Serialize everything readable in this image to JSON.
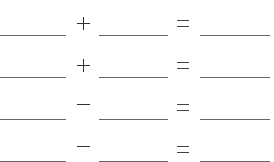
{
  "worksheet": {
    "rows": [
      {
        "left": "",
        "operator": "+",
        "middle": "",
        "equals": "=",
        "result": ""
      },
      {
        "left": "",
        "operator": "+",
        "middle": "",
        "equals": "=",
        "result": ""
      },
      {
        "left": "",
        "operator": "−",
        "middle": "",
        "equals": "=",
        "result": ""
      },
      {
        "left": "",
        "operator": "−",
        "middle": "",
        "equals": "=",
        "result": ""
      }
    ],
    "line_color": "#666666",
    "symbol_color": "#333333"
  }
}
